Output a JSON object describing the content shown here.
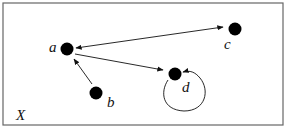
{
  "diagram": {
    "frame_label": "X",
    "nodes": [
      {
        "id": "a",
        "label": "a",
        "x": 67,
        "y": 49
      },
      {
        "id": "b",
        "label": "b",
        "x": 96,
        "y": 93
      },
      {
        "id": "c",
        "label": "c",
        "x": 235,
        "y": 29
      },
      {
        "id": "d",
        "label": "d",
        "x": 175,
        "y": 74
      }
    ],
    "edges": [
      {
        "from": "a",
        "to": "c",
        "bidirectional": true
      },
      {
        "from": "a",
        "to": "d",
        "bidirectional": false
      },
      {
        "from": "b",
        "to": "a",
        "bidirectional": false
      },
      {
        "from": "d",
        "to": "d",
        "self_loop": true
      }
    ],
    "colors": {
      "stroke": "#111111",
      "node": "#000000",
      "frame": "#666666"
    }
  }
}
